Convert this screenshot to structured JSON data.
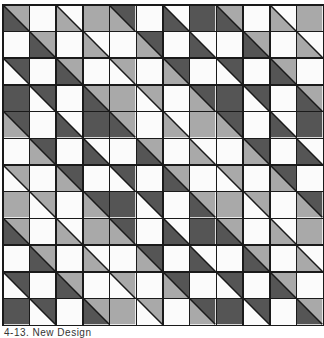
{
  "colors": {
    "W": "#fbfbfb",
    "L": "#a9a9a9",
    "D": "#555555",
    "line": "#1a1a1a"
  },
  "legend": {
    "W": "white",
    "L": "light-gray",
    "D": "dark-gray",
    "pair": "top-right/bottom-left halves split by diagonal from top-left to bottom-right"
  },
  "grid": {
    "rows": 12,
    "cols": 12,
    "cells": [
      [
        "LD",
        "W",
        "WL",
        "L",
        "DL",
        "W",
        "WD",
        "D",
        "LD",
        "W",
        "WL",
        "L"
      ],
      [
        "W",
        "LD",
        "W",
        "WL",
        "W",
        "DL",
        "W",
        "WD",
        "W",
        "LD",
        "W",
        "WL"
      ],
      [
        "DW",
        "W",
        "LD",
        "W",
        "LW",
        "W",
        "DL",
        "W",
        "DW",
        "W",
        "LD",
        "W"
      ],
      [
        "D",
        "DW",
        "W",
        "LD",
        "L",
        "LW",
        "W",
        "DL",
        "D",
        "DW",
        "W",
        "LD"
      ],
      [
        "DL",
        "W",
        "WD",
        "D",
        "LD",
        "W",
        "WL",
        "L",
        "DL",
        "W",
        "WD",
        "D"
      ],
      [
        "W",
        "DL",
        "W",
        "WD",
        "W",
        "LD",
        "W",
        "WL",
        "W",
        "DL",
        "W",
        "WD"
      ],
      [
        "LW",
        "W",
        "DL",
        "W",
        "DW",
        "W",
        "LD",
        "W",
        "LW",
        "W",
        "DL",
        "W"
      ],
      [
        "L",
        "LW",
        "W",
        "DL",
        "D",
        "DW",
        "W",
        "LD",
        "L",
        "LW",
        "W",
        "DL"
      ],
      [
        "LD",
        "W",
        "WL",
        "L",
        "DL",
        "W",
        "WD",
        "D",
        "LD",
        "W",
        "WL",
        "L"
      ],
      [
        "W",
        "LD",
        "W",
        "WL",
        "W",
        "DL",
        "W",
        "WD",
        "W",
        "LD",
        "W",
        "WL"
      ],
      [
        "DW",
        "W",
        "LD",
        "W",
        "LW",
        "W",
        "DL",
        "W",
        "DW",
        "W",
        "LD",
        "W"
      ],
      [
        "D",
        "DW",
        "W",
        "LD",
        "L",
        "LW",
        "W",
        "DL",
        "D",
        "DW",
        "W",
        "LD"
      ]
    ]
  },
  "caption": "4-13. New Design"
}
